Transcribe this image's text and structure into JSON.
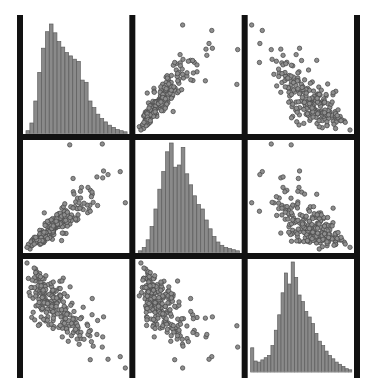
{
  "figure": {
    "title": "",
    "type": "scatter-plot-matrix",
    "background_color": "#ffffff",
    "grid_color": "#111111",
    "point_fill_color": "#8e8e8e",
    "point_stroke_color": "#4a4a4a",
    "bar_fill_color": "#8a8a8a",
    "bar_stroke_color": "#5d5d5d",
    "n_rows": 3,
    "n_cols": 3,
    "plot_left": 20,
    "plot_top": 18,
    "plot_right": 357,
    "plot_bottom": 375,
    "divider_thickness": 6,
    "variables": [
      "V1",
      "V2",
      "V3"
    ]
  },
  "chart_data": {
    "type": "scatter",
    "title": "",
    "subtitle": "",
    "xlabel": "",
    "ylabel": "",
    "grid": false,
    "legend": "none",
    "layout": "3x3 pairs plot; diagonal = histograms, off-diagonal = scatter",
    "axis_ranges": {
      "V1": [
        0,
        1
      ],
      "V2": [
        0,
        1
      ],
      "V3": [
        0,
        1
      ]
    },
    "panels": [
      {
        "row": 0,
        "col": 0,
        "kind": "histogram",
        "variable": "V1",
        "xlabel": "V1",
        "ylabel": "count",
        "ylim": [
          0,
          1
        ],
        "bins": 26,
        "values": [
          0.03,
          0.1,
          0.3,
          0.56,
          0.78,
          0.93,
          1.0,
          0.92,
          0.84,
          0.79,
          0.74,
          0.71,
          0.68,
          0.66,
          0.49,
          0.47,
          0.3,
          0.24,
          0.18,
          0.14,
          0.11,
          0.08,
          0.06,
          0.04,
          0.03,
          0.02
        ]
      },
      {
        "row": 0,
        "col": 1,
        "kind": "scatter",
        "xvar": "V2",
        "yvar": "V1",
        "relationship": "strong positive, fan-shaped with upper outliers",
        "n_points": 235,
        "correlation": 0.88
      },
      {
        "row": 0,
        "col": 2,
        "kind": "scatter",
        "xvar": "V3",
        "yvar": "V1",
        "relationship": "negative, wedge shaped dense band",
        "n_points": 235,
        "correlation": -0.62
      },
      {
        "row": 1,
        "col": 0,
        "kind": "scatter",
        "xvar": "V1",
        "yvar": "V2",
        "relationship": "strong positive, fan-shaped with upper outliers",
        "n_points": 235,
        "correlation": 0.88
      },
      {
        "row": 1,
        "col": 1,
        "kind": "histogram",
        "variable": "V2",
        "xlabel": "V2",
        "ylabel": "count",
        "ylim": [
          0,
          1
        ],
        "bins": 26,
        "values": [
          0.02,
          0.05,
          0.12,
          0.24,
          0.4,
          0.58,
          0.74,
          0.92,
          1.0,
          0.78,
          0.8,
          0.96,
          0.72,
          0.62,
          0.52,
          0.44,
          0.4,
          0.3,
          0.22,
          0.15,
          0.1,
          0.07,
          0.05,
          0.04,
          0.03,
          0.02
        ]
      },
      {
        "row": 1,
        "col": 2,
        "kind": "scatter",
        "xvar": "V3",
        "yvar": "V2",
        "relationship": "negative, dense left cluster with tail",
        "n_points": 235,
        "correlation": -0.58
      },
      {
        "row": 2,
        "col": 0,
        "kind": "scatter",
        "xvar": "V1",
        "yvar": "V3",
        "relationship": "negative, wedge shaped dense band",
        "n_points": 235,
        "correlation": -0.62
      },
      {
        "row": 2,
        "col": 1,
        "kind": "scatter",
        "xvar": "V2",
        "yvar": "V3",
        "relationship": "negative, dense left cluster with right tail",
        "n_points": 235,
        "correlation": -0.58
      },
      {
        "row": 2,
        "col": 2,
        "kind": "histogram",
        "variable": "V3",
        "xlabel": "V3",
        "ylabel": "count",
        "ylim": [
          0,
          1
        ],
        "bins": 30,
        "values": [
          0.22,
          0.1,
          0.09,
          0.11,
          0.13,
          0.15,
          0.24,
          0.38,
          0.52,
          0.72,
          0.9,
          0.8,
          1.0,
          0.86,
          0.7,
          0.64,
          0.55,
          0.5,
          0.44,
          0.35,
          0.28,
          0.24,
          0.19,
          0.15,
          0.12,
          0.09,
          0.07,
          0.05,
          0.03,
          0.02
        ]
      }
    ]
  }
}
